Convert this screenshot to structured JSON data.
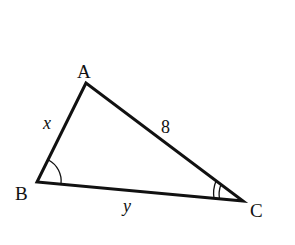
{
  "diagram": {
    "type": "triangle",
    "stroke_color": "#111111",
    "background": "#ffffff",
    "vertices": [
      {
        "name": "A",
        "label": "A",
        "x": 86,
        "y": 83,
        "label_x": 84,
        "label_y": 78
      },
      {
        "name": "B",
        "label": "B",
        "x": 37,
        "y": 182,
        "label_x": 22,
        "label_y": 200
      },
      {
        "name": "C",
        "label": "C",
        "x": 243,
        "y": 201,
        "label_x": 258,
        "label_y": 217
      }
    ],
    "sides": [
      {
        "between": "AB",
        "label": "x",
        "italic": true,
        "label_x": 48,
        "label_y": 129
      },
      {
        "between": "AC",
        "label": "8",
        "italic": false,
        "label_x": 166,
        "label_y": 132
      },
      {
        "between": "BC",
        "label": "y",
        "italic": true,
        "label_x": 128,
        "label_y": 210
      }
    ],
    "angle_marks": [
      {
        "vertex": "B",
        "arcs": 1
      },
      {
        "vertex": "C",
        "arcs": 2
      }
    ]
  }
}
